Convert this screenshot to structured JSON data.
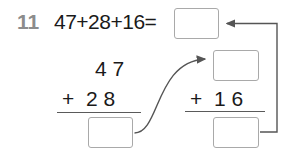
{
  "page": {
    "width": 292,
    "height": 156,
    "background": "#ffffff"
  },
  "question": {
    "number": "11",
    "number_color": "#8c8c8c",
    "equation": "47+28+16=",
    "text_color": "#1a1a1a"
  },
  "left_column_addition": {
    "addend_top": "4 7",
    "addend_bottom": "+  2 8",
    "rule": "horizontal-line",
    "sum_box_value": ""
  },
  "right_column_addition": {
    "addend_top_box_value": "",
    "addend_bottom": "+  1 6",
    "rule": "horizontal-line",
    "sum_box_value": ""
  },
  "total_box": {
    "value": ""
  },
  "connectors": [
    {
      "name": "left-sum-to-right-top",
      "style": "curved-arrow",
      "from": "left-sum-box",
      "to": "right-top-box",
      "color": "#555555"
    },
    {
      "name": "right-sum-to-total",
      "style": "elbow-arrow",
      "from": "right-sum-box",
      "to": "total-box",
      "color": "#555555"
    }
  ],
  "colors": {
    "box_border": "#a9a9a9",
    "rule_line": "#5a5a5a",
    "connector": "#555555",
    "ink": "#1a1a1a",
    "muted": "#8c8c8c"
  }
}
